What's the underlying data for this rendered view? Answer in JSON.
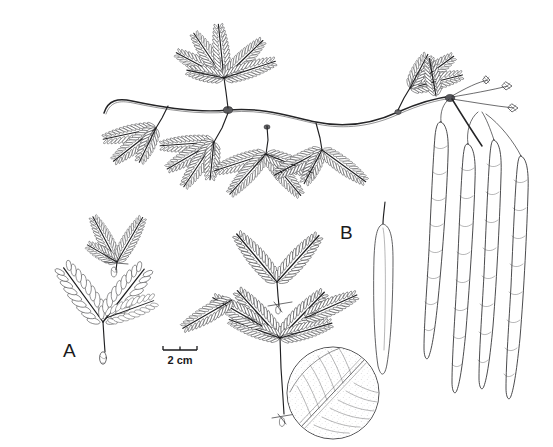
{
  "figure": {
    "kind": "botanical-line-illustration",
    "background_color": "#ffffff",
    "ink_color": "#2e2e30",
    "width": 553,
    "height": 447
  },
  "labels": {
    "leaf_a": "A",
    "leaf_b": "B"
  },
  "scale": {
    "text": "2 cm",
    "bar_length_px": 34,
    "ticks": 3
  },
  "parts": [
    {
      "name": "flowering-branch",
      "description": "Horizontal stem bearing bipinnate leaves and flower peduncles"
    },
    {
      "name": "leaf-a",
      "description": "Bipinnate leaf with broad oblong leaflets"
    },
    {
      "name": "leaf-b",
      "description": "Bipinnate leaf with narrow linear leaflets"
    },
    {
      "name": "flower-spike",
      "description": "Dense cylindrical stippled inflorescence spike"
    },
    {
      "name": "pod-cluster",
      "description": "Four pendulous legume pods with constricted seed segments"
    },
    {
      "name": "venation-inset",
      "description": "Circular magnified detail of leaflet venation"
    },
    {
      "name": "petiolar-gland",
      "description": "Gland detail at base of petiole"
    }
  ]
}
